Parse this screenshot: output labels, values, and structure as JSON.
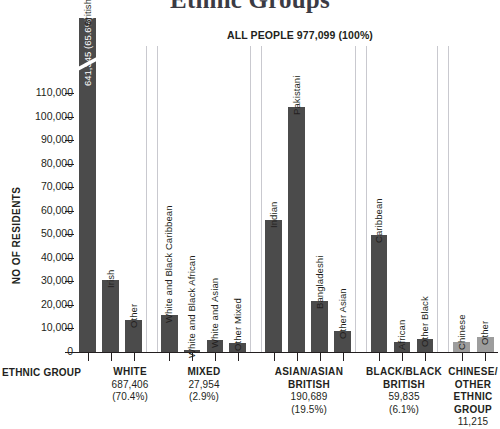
{
  "chart_data": {
    "type": "bar",
    "title": "Ethnic Groups",
    "subtitle": "ALL PEOPLE 977,099 (100%)",
    "xlabel": "ETHNIC GROUP",
    "ylabel": "NO OF RESIDENTS",
    "ylim": [
      0,
      110000
    ],
    "yticks": [
      "0",
      "10,000",
      "20,000",
      "30,000",
      "40,000",
      "50,000",
      "60,000",
      "70,000",
      "80,000",
      "90,000",
      "100,000",
      "110,000"
    ],
    "grid": false,
    "legend": "none",
    "axis_break_note": "British bar is broken; true value 641,345 exceeds axis maximum",
    "categories": [
      "British",
      "Irish",
      "Other",
      "White and Black Caribbean",
      "White and Black African",
      "White and Asian",
      "Other Mixed",
      "Indian",
      "Pakistani",
      "Bangladeshi",
      "Other Asian",
      "Caribbean",
      "African",
      "Other Black",
      "Chinese",
      "Other"
    ],
    "values": [
      641345,
      30500,
      13800,
      15600,
      600,
      5300,
      3900,
      56000,
      104000,
      21800,
      9000,
      49500,
      4300,
      5600,
      4300,
      6400
    ],
    "groups": [
      {
        "name": "WHITE",
        "total": "687,406",
        "percent": "(70.4%)",
        "bars": [
          {
            "label": "British",
            "value": 641345,
            "display_value": "641,345 (65.6%)",
            "broken": true,
            "shade": "dark"
          },
          {
            "label": "Irish",
            "value": 30500,
            "shade": "dark"
          },
          {
            "label": "Other",
            "value": 13800,
            "shade": "dark"
          }
        ]
      },
      {
        "name": "MIXED",
        "total": "27,954",
        "percent": "(2.9%)",
        "bars": [
          {
            "label": "White and Black Caribbean",
            "value": 15600,
            "shade": "dark"
          },
          {
            "label": "White and Black African",
            "value": 600,
            "shade": "dark"
          },
          {
            "label": "White and Asian",
            "value": 5300,
            "shade": "dark"
          },
          {
            "label": "Other Mixed",
            "value": 3900,
            "shade": "dark"
          }
        ]
      },
      {
        "name": "ASIAN/ASIAN BRITISH",
        "total": "190,689",
        "percent": "(19.5%)",
        "bars": [
          {
            "label": "Indian",
            "value": 56000,
            "shade": "dark"
          },
          {
            "label": "Pakistani",
            "value": 104000,
            "shade": "dark"
          },
          {
            "label": "Bangladeshi",
            "value": 21800,
            "shade": "dark"
          },
          {
            "label": "Other Asian",
            "value": 9000,
            "shade": "dark"
          }
        ]
      },
      {
        "name": "BLACK/BLACK BRITISH",
        "total": "59,835",
        "percent": "(6.1%)",
        "bars": [
          {
            "label": "Caribbean",
            "value": 49500,
            "shade": "dark"
          },
          {
            "label": "African",
            "value": 4300,
            "shade": "dark"
          },
          {
            "label": "Other Black",
            "value": 5600,
            "shade": "dark"
          }
        ]
      },
      {
        "name": "CHINESE/ OTHER ETHNIC GROUP",
        "total": "11,215",
        "percent": "",
        "bars": [
          {
            "label": "Chinese",
            "value": 4300,
            "shade": "light"
          },
          {
            "label": "Other",
            "value": 6400,
            "shade": "light"
          }
        ]
      }
    ],
    "colors": {
      "bar_dark": "#4b4b4b",
      "bar_light": "#9d9d9d",
      "axis": "#231f20",
      "separator": "#c9c9cf",
      "title": "#3b3b44",
      "background": "#ffffff"
    }
  },
  "groups_footer": [
    {
      "name": "WHITE",
      "total": "687,406",
      "percent": "(70.4%)"
    },
    {
      "name": "MIXED",
      "total": "27,954",
      "percent": "(2.9%)"
    },
    {
      "name": "ASIAN/ASIAN BRITISH",
      "total": "190,689",
      "percent": "(19.5%)"
    },
    {
      "name": "BLACK/BLACK BRITISH",
      "total": "59,835",
      "percent": "(6.1%)"
    },
    {
      "name": "CHINESE/ OTHER ETHNIC GROUP",
      "total": "11,215",
      "percent": ""
    }
  ]
}
